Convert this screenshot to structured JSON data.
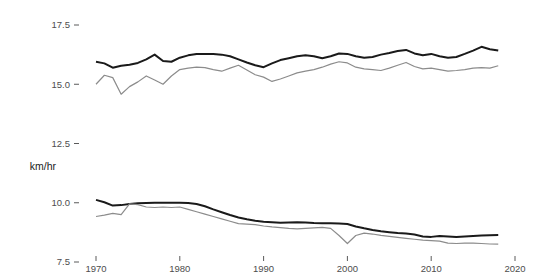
{
  "figure": {
    "background_color": "#ffffff",
    "axis_title_y": "km/hr",
    "axis_title_x": ""
  },
  "chart_data": {
    "type": "line",
    "title": "",
    "subtitle": "",
    "xlabel": "",
    "ylabel": "km/hr",
    "xlim": [
      1969.5,
      2020.5
    ],
    "ylim": [
      7.0,
      18.0
    ],
    "grid": false,
    "legend": "none",
    "x_ticks": [
      1970,
      1980,
      1990,
      2000,
      2010,
      2020
    ],
    "x_tick_labels": [
      "1970",
      "1980",
      "1990",
      "2000",
      "2010",
      "2020"
    ],
    "y_ticks": [
      7.5,
      10.0,
      12.5,
      15.0,
      17.5
    ],
    "y_tick_labels": [
      "7.5",
      "10.0",
      "12.5",
      "15.0",
      "17.5"
    ],
    "x": [
      1970,
      1971,
      1972,
      1973,
      1974,
      1975,
      1976,
      1977,
      1978,
      1979,
      1980,
      1981,
      1982,
      1983,
      1984,
      1985,
      1986,
      1987,
      1988,
      1989,
      1990,
      1991,
      1992,
      1993,
      1994,
      1995,
      1996,
      1997,
      1998,
      1999,
      2000,
      2001,
      2002,
      2003,
      2004,
      2005,
      2006,
      2007,
      2008,
      2009,
      2010,
      2011,
      2012,
      2013,
      2014,
      2015,
      2016,
      2017,
      2018
    ],
    "series": [
      {
        "name": "upper-black",
        "color": "#1a1a1a",
        "width": 2.0,
        "values": [
          15.95,
          15.88,
          15.7,
          15.78,
          15.82,
          15.9,
          16.05,
          16.25,
          15.98,
          15.95,
          16.12,
          16.22,
          16.28,
          16.28,
          16.28,
          16.25,
          16.18,
          16.05,
          15.92,
          15.8,
          15.72,
          15.88,
          16.02,
          16.1,
          16.18,
          16.22,
          16.18,
          16.1,
          16.18,
          16.3,
          16.28,
          16.18,
          16.12,
          16.15,
          16.25,
          16.32,
          16.4,
          16.45,
          16.3,
          16.22,
          16.28,
          16.18,
          16.12,
          16.15,
          16.28,
          16.42,
          16.58,
          16.48,
          16.42
        ]
      },
      {
        "name": "upper-gray",
        "color": "#8c8c8c",
        "width": 1.2,
        "values": [
          15.0,
          15.38,
          15.28,
          14.58,
          14.9,
          15.1,
          15.35,
          15.18,
          15.0,
          15.35,
          15.62,
          15.68,
          15.72,
          15.7,
          15.62,
          15.55,
          15.68,
          15.8,
          15.6,
          15.4,
          15.3,
          15.12,
          15.22,
          15.35,
          15.48,
          15.55,
          15.62,
          15.72,
          15.85,
          15.95,
          15.9,
          15.72,
          15.65,
          15.62,
          15.58,
          15.68,
          15.8,
          15.92,
          15.75,
          15.65,
          15.68,
          15.62,
          15.55,
          15.58,
          15.62,
          15.68,
          15.7,
          15.68,
          15.78
        ]
      },
      {
        "name": "lower-black",
        "color": "#1a1a1a",
        "width": 2.0,
        "values": [
          10.12,
          10.02,
          9.88,
          9.9,
          9.95,
          9.98,
          9.99,
          10.0,
          10.0,
          10.0,
          10.0,
          9.99,
          9.95,
          9.85,
          9.72,
          9.6,
          9.48,
          9.38,
          9.3,
          9.24,
          9.2,
          9.18,
          9.16,
          9.17,
          9.18,
          9.17,
          9.15,
          9.14,
          9.13,
          9.12,
          9.1,
          9.0,
          8.92,
          8.85,
          8.8,
          8.76,
          8.72,
          8.7,
          8.66,
          8.58,
          8.56,
          8.6,
          8.58,
          8.56,
          8.58,
          8.6,
          8.62,
          8.63,
          8.64
        ]
      },
      {
        "name": "lower-gray",
        "color": "#8c8c8c",
        "width": 1.2,
        "values": [
          9.42,
          9.48,
          9.55,
          9.5,
          9.95,
          9.92,
          9.82,
          9.8,
          9.82,
          9.8,
          9.82,
          9.72,
          9.62,
          9.52,
          9.42,
          9.32,
          9.22,
          9.12,
          9.1,
          9.08,
          9.02,
          8.98,
          8.95,
          8.92,
          8.9,
          8.92,
          8.94,
          8.96,
          8.92,
          8.62,
          8.28,
          8.62,
          8.72,
          8.68,
          8.62,
          8.58,
          8.54,
          8.5,
          8.46,
          8.42,
          8.4,
          8.38,
          8.3,
          8.28,
          8.3,
          8.3,
          8.28,
          8.26,
          8.25
        ]
      }
    ]
  }
}
